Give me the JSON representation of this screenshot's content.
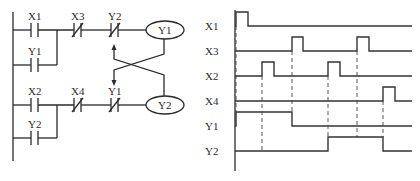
{
  "ladder": {
    "rung1": {
      "contacts": [
        {
          "label": "X1",
          "type": "NO"
        },
        {
          "label": "X3",
          "type": "NC"
        },
        {
          "label": "Y2",
          "type": "NC"
        }
      ],
      "branch": {
        "label": "Y1",
        "type": "NO"
      },
      "coil": "Y1"
    },
    "rung2": {
      "contacts": [
        {
          "label": "X2",
          "type": "NO"
        },
        {
          "label": "X4",
          "type": "NC"
        },
        {
          "label": "Y1",
          "type": "NC"
        }
      ],
      "branch": {
        "label": "Y2",
        "type": "NO"
      },
      "coil": "Y2"
    },
    "interlock_note": "Cross-coupled interlock: Y1 coil drives NC Y1 in rung 2; Y2 coil drives NC Y2 in rung 1"
  },
  "timing": {
    "signals": [
      {
        "label": "X1",
        "edges": [
          [
            0,
            1
          ],
          [
            12,
            0
          ]
        ]
      },
      {
        "label": "X3",
        "edges": [
          [
            56,
            1
          ],
          [
            67,
            0
          ],
          [
            121,
            1
          ],
          [
            133,
            0
          ]
        ]
      },
      {
        "label": "X2",
        "edges": [
          [
            26,
            1
          ],
          [
            38,
            0
          ],
          [
            92,
            1
          ],
          [
            104,
            0
          ]
        ]
      },
      {
        "label": "X4",
        "edges": [
          [
            147,
            1
          ],
          [
            159,
            0
          ]
        ]
      },
      {
        "label": "Y1",
        "edges": [
          [
            0,
            1
          ],
          [
            56,
            0
          ]
        ]
      },
      {
        "label": "Y2",
        "edges": [
          [
            92,
            1
          ],
          [
            147,
            0
          ]
        ]
      }
    ],
    "dashed_marks": [
      0,
      26,
      56,
      92,
      121,
      147
    ]
  },
  "colors": {
    "line": "#2b2b2b",
    "background": "#ffffff"
  }
}
